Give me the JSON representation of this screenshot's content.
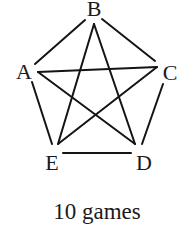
{
  "diagram": {
    "type": "complete-graph",
    "nodes": [
      {
        "id": "A",
        "label": "A",
        "lx": 24,
        "ly": 79
      },
      {
        "id": "B",
        "label": "B",
        "lx": 94,
        "ly": 16
      },
      {
        "id": "C",
        "label": "C",
        "lx": 170,
        "ly": 80
      },
      {
        "id": "D",
        "label": "D",
        "lx": 144,
        "ly": 170
      },
      {
        "id": "E",
        "label": "E",
        "lx": 52,
        "ly": 170
      }
    ],
    "edges": [
      {
        "from": "A",
        "to": "B",
        "x1": 35,
        "y1": 64,
        "x2": 85,
        "y2": 20
      },
      {
        "from": "B",
        "to": "C",
        "x1": 102,
        "y1": 19,
        "x2": 155,
        "y2": 61
      },
      {
        "from": "A",
        "to": "C",
        "x1": 38,
        "y1": 72,
        "x2": 157,
        "y2": 67
      },
      {
        "from": "A",
        "to": "E",
        "x1": 32,
        "y1": 82,
        "x2": 52,
        "y2": 144
      },
      {
        "from": "C",
        "to": "D",
        "x1": 163,
        "y1": 84,
        "x2": 142,
        "y2": 144
      },
      {
        "from": "E",
        "to": "D",
        "x1": 63,
        "y1": 153,
        "x2": 131,
        "y2": 153
      },
      {
        "from": "B",
        "to": "E",
        "x1": 94,
        "y1": 24,
        "x2": 58,
        "y2": 144
      },
      {
        "from": "B",
        "to": "D",
        "x1": 94,
        "y1": 24,
        "x2": 135,
        "y2": 144
      },
      {
        "from": "A",
        "to": "D",
        "x1": 38,
        "y1": 72,
        "x2": 135,
        "y2": 144
      },
      {
        "from": "C",
        "to": "E",
        "x1": 157,
        "y1": 67,
        "x2": 58,
        "y2": 144
      }
    ],
    "caption": "10 games"
  }
}
